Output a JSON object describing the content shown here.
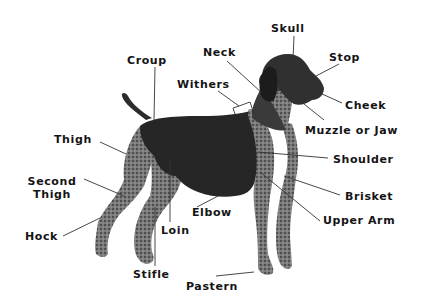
{
  "diagram": {
    "colors": {
      "background": "#ffffff",
      "text": "#141414",
      "leader": "#333333",
      "dog_dark": "#2a2a2a",
      "dog_roan": "#6e6e6e"
    },
    "labels": {
      "skull": "Skull",
      "stop": "Stop",
      "neck": "Neck",
      "croup": "Croup",
      "withers": "Withers",
      "cheek": "Cheek",
      "muzzle_or_jaw": "Muzzle or Jaw",
      "thigh": "Thigh",
      "shoulder": "Shoulder",
      "second_thigh_line1": "Second",
      "second_thigh_line2": "Thigh",
      "brisket": "Brisket",
      "elbow": "Elbow",
      "upper_arm": "Upper Arm",
      "hock": "Hock",
      "loin": "Loin",
      "stifle": "Stifle",
      "pastern": "Pastern"
    }
  }
}
